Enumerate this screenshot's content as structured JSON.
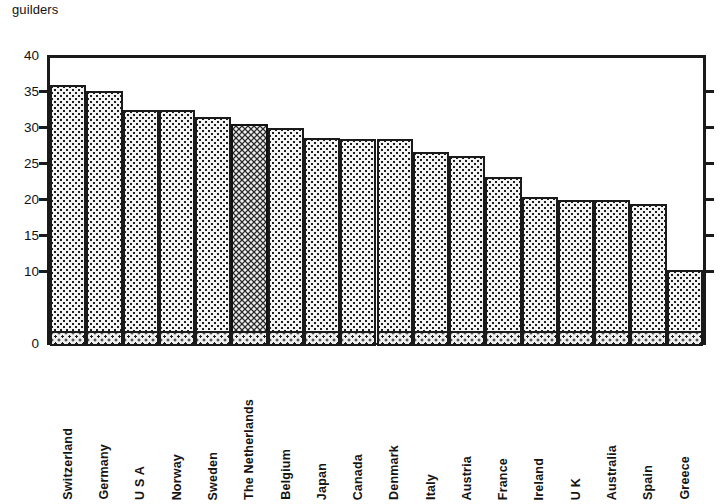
{
  "chart_data": {
    "type": "bar",
    "title": "",
    "subtitle": "",
    "unit_caption": "guilders",
    "xlabel": "",
    "ylabel": "guilders",
    "ylim": [
      0,
      40
    ],
    "grid": false,
    "legend": "none",
    "ytick_labels": [
      "40",
      "35",
      "30",
      "25",
      "20",
      "15",
      "10",
      "0"
    ],
    "ytick_values": [
      40,
      35,
      30,
      25,
      20,
      15,
      10,
      0
    ],
    "highlight_category": "The Netherlands",
    "categories": [
      "Switzerland",
      "Germany",
      "U S A",
      "Norway",
      "Sweden",
      "The Netherlands",
      "Belgium",
      "Japan",
      "Canada",
      "Denmark",
      "Italy",
      "Austria",
      "France",
      "Ireland",
      "U K",
      "Australia",
      "Spain",
      "Greece"
    ],
    "values": [
      35.8,
      35.0,
      32.4,
      32.4,
      31.4,
      30.4,
      29.8,
      28.5,
      28.3,
      28.3,
      26.5,
      26.0,
      23.1,
      20.3,
      19.9,
      19.8,
      19.3,
      10.2
    ]
  }
}
